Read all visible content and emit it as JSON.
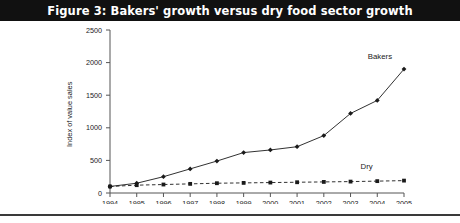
{
  "figure": {
    "title": "Figure 3: Bakers' growth versus dry food sector growth",
    "title_bar_color": "#111111",
    "title_text_color": "#ffffff",
    "background_color": "#ffffff",
    "rule_color": "#3a3a3a"
  },
  "chart_data": {
    "type": "line",
    "title": "Figure 3: Bakers' growth versus dry food sector growth",
    "xlabel": "",
    "ylabel": "Index of value sales",
    "x": [
      1994,
      1995,
      1996,
      1997,
      1998,
      1999,
      2000,
      2001,
      2002,
      2003,
      2004,
      2005
    ],
    "xtick_labels": [
      "1994",
      "1995",
      "1996",
      "1997",
      "1998",
      "1999",
      "2000",
      "2001",
      "2002",
      "2003",
      "2004",
      "2005"
    ],
    "ytick_labels": [
      "0",
      "500",
      "1000",
      "1500",
      "2000",
      "2500"
    ],
    "yticks": [
      0,
      500,
      1000,
      1500,
      2000,
      2500
    ],
    "ylim": [
      0,
      2500
    ],
    "xlim": [
      1994,
      2005
    ],
    "grid": false,
    "legend_position": "inline-end-of-line",
    "series": [
      {
        "name": "Bakers",
        "values": [
          100,
          150,
          250,
          370,
          490,
          620,
          660,
          710,
          880,
          1220,
          1420,
          1900
        ],
        "line_style": "solid",
        "marker": "diamond",
        "color": "#1a1a1a",
        "label_x": 2004.1,
        "label_y": 2060
      },
      {
        "name": "Dry",
        "values": [
          100,
          120,
          130,
          140,
          150,
          155,
          160,
          165,
          170,
          175,
          182,
          190
        ],
        "line_style": "dashed",
        "marker": "square",
        "color": "#1a1a1a",
        "label_x": 2003.6,
        "label_y": 370
      }
    ]
  }
}
